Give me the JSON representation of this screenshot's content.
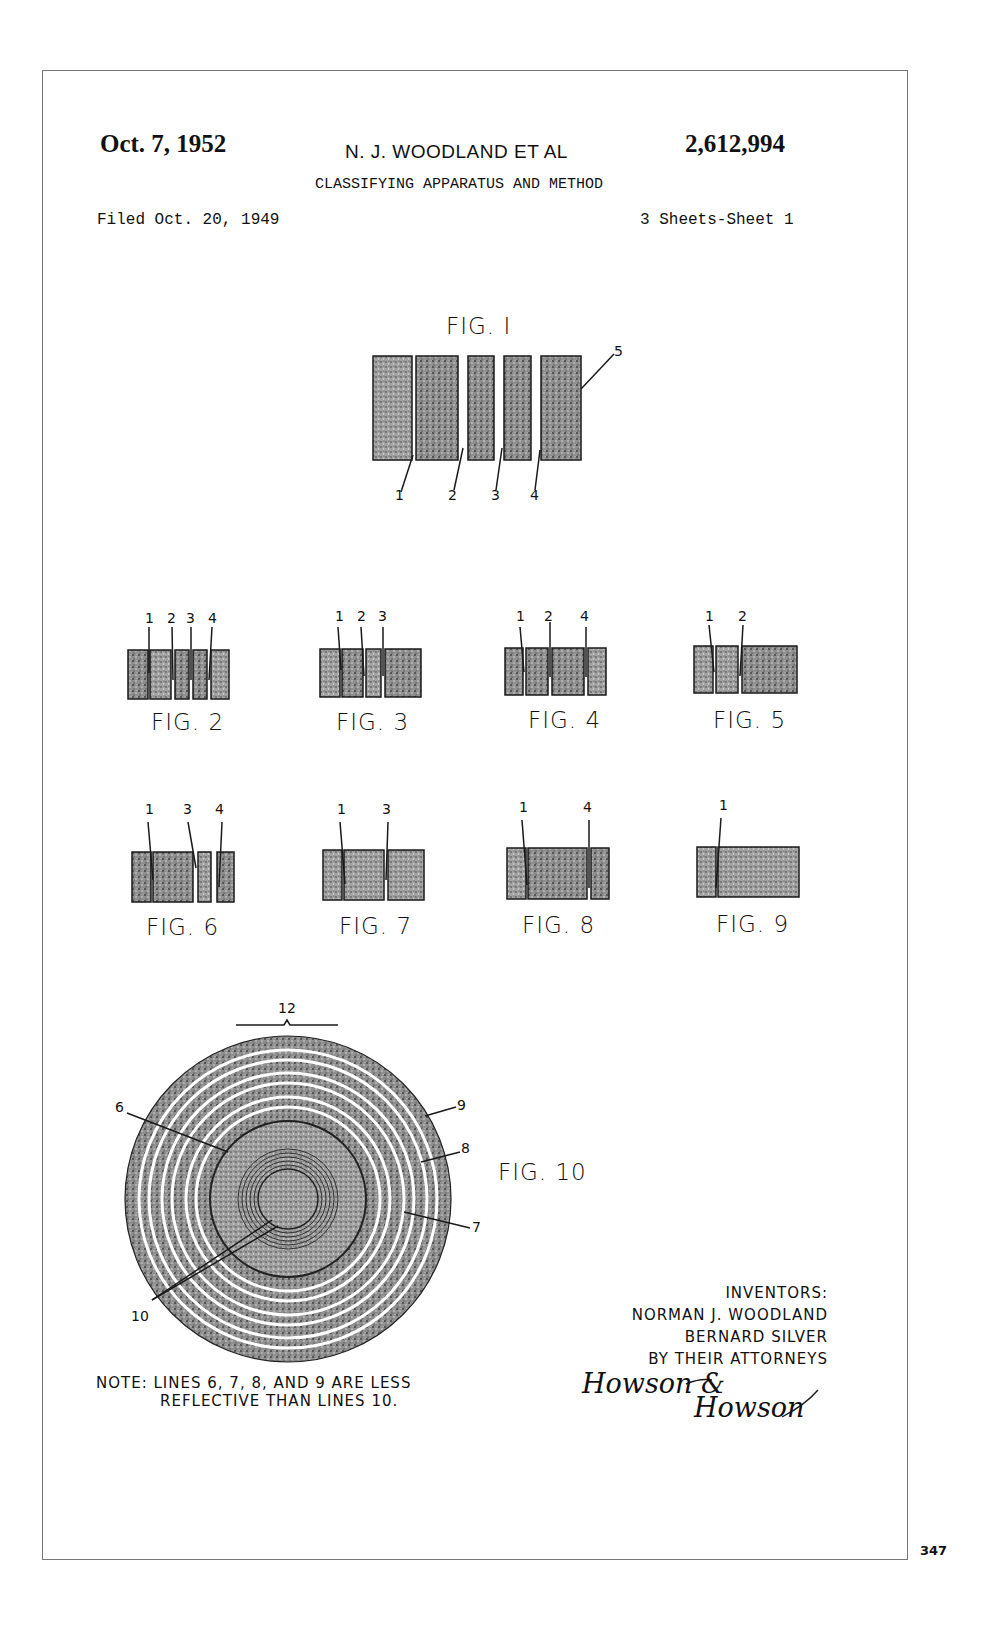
{
  "header": {
    "date": "Oct. 7, 1952",
    "inventors_short": "N. J. WOODLAND ET AL",
    "patent_number": "2,612,994",
    "title": "CLASSIFYING APPARATUS AND METHOD",
    "filed": "Filed Oct. 20, 1949",
    "sheets": "3 Sheets-Sheet 1"
  },
  "figures": {
    "fig1": {
      "label": "FIG. I",
      "refs": [
        "1",
        "2",
        "3",
        "4",
        "5"
      ]
    },
    "fig2": {
      "label": "FIG. 2",
      "refs": [
        "1",
        "2",
        "3",
        "4"
      ]
    },
    "fig3": {
      "label": "FIG. 3",
      "refs": [
        "1",
        "2",
        "3"
      ]
    },
    "fig4": {
      "label": "FIG. 4",
      "refs": [
        "1",
        "2",
        "4"
      ]
    },
    "fig5": {
      "label": "FIG. 5",
      "refs": [
        "1",
        "2"
      ]
    },
    "fig6": {
      "label": "FIG. 6",
      "refs": [
        "1",
        "3",
        "4"
      ]
    },
    "fig7": {
      "label": "FIG. 7",
      "refs": [
        "1",
        "3"
      ]
    },
    "fig8": {
      "label": "FIG. 8",
      "refs": [
        "1",
        "4"
      ]
    },
    "fig9": {
      "label": "FIG. 9",
      "refs": [
        "1"
      ]
    },
    "fig10": {
      "label": "FIG. 10",
      "refs": [
        "12",
        "6",
        "9",
        "8",
        "7",
        "10"
      ]
    }
  },
  "note": {
    "line1": "NOTE: LINES 6, 7, 8, AND 9 ARE LESS",
    "line2": "REFLECTIVE THAN LINES 10."
  },
  "inventors": {
    "heading": "INVENTORS:",
    "name1": "NORMAN J. WOODLAND",
    "name2": "BERNARD SILVER",
    "by_line": "BY THEIR ATTORNEYS",
    "signature1": "Howson &",
    "signature2": "Howson"
  },
  "page_number": "347",
  "colors": {
    "ink": "#1a1a1a",
    "stipple": "#7a7a7a",
    "frame": "#777777"
  }
}
